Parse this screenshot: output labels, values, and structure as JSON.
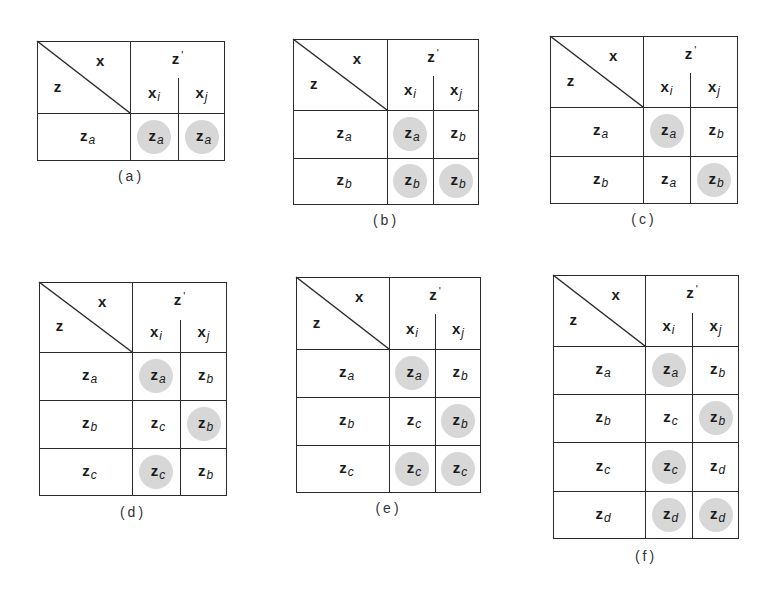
{
  "figure": {
    "highlight_color": "#d7d7d7",
    "line_color": "#2a2a2a",
    "header": {
      "row_var": "z",
      "col_var": "x",
      "next_state": "z",
      "next_state_prime": "'",
      "input_i": "x",
      "input_i_sub": "i",
      "input_j": "x",
      "input_j_sub": "j"
    },
    "panels": [
      {
        "caption": "(a)",
        "rows": [
          {
            "state": "a",
            "xi": "a",
            "xj": "a",
            "xi_hl": true,
            "xj_hl": true
          }
        ]
      },
      {
        "caption": "(b)",
        "rows": [
          {
            "state": "a",
            "xi": "a",
            "xj": "b",
            "xi_hl": true,
            "xj_hl": false
          },
          {
            "state": "b",
            "xi": "b",
            "xj": "b",
            "xi_hl": true,
            "xj_hl": true
          }
        ]
      },
      {
        "caption": "(c)",
        "rows": [
          {
            "state": "a",
            "xi": "a",
            "xj": "b",
            "xi_hl": true,
            "xj_hl": false
          },
          {
            "state": "b",
            "xi": "a",
            "xj": "b",
            "xi_hl": false,
            "xj_hl": true
          }
        ]
      },
      {
        "caption": "(d)",
        "rows": [
          {
            "state": "a",
            "xi": "a",
            "xj": "b",
            "xi_hl": true,
            "xj_hl": false
          },
          {
            "state": "b",
            "xi": "c",
            "xj": "b",
            "xi_hl": false,
            "xj_hl": true
          },
          {
            "state": "c",
            "xi": "c",
            "xj": "b",
            "xi_hl": true,
            "xj_hl": false
          }
        ]
      },
      {
        "caption": "(e)",
        "rows": [
          {
            "state": "a",
            "xi": "a",
            "xj": "b",
            "xi_hl": true,
            "xj_hl": false
          },
          {
            "state": "b",
            "xi": "c",
            "xj": "b",
            "xi_hl": false,
            "xj_hl": true
          },
          {
            "state": "c",
            "xi": "c",
            "xj": "c",
            "xi_hl": true,
            "xj_hl": true
          }
        ]
      },
      {
        "caption": "(f)",
        "rows": [
          {
            "state": "a",
            "xi": "a",
            "xj": "b",
            "xi_hl": true,
            "xj_hl": false
          },
          {
            "state": "b",
            "xi": "c",
            "xj": "b",
            "xi_hl": false,
            "xj_hl": true
          },
          {
            "state": "c",
            "xi": "c",
            "xj": "d",
            "xi_hl": true,
            "xj_hl": false
          },
          {
            "state": "d",
            "xi": "d",
            "xj": "d",
            "xi_hl": true,
            "xj_hl": true
          }
        ]
      }
    ]
  }
}
